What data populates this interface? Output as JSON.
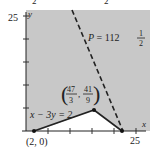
{
  "figure": {
    "type": "linear-programming-feasible-region",
    "axes": {
      "x_label": "x",
      "y_label": "y",
      "x_max_tick_label": "25",
      "y_max_tick_label": "25",
      "x_range": [
        0,
        25
      ],
      "y_range": [
        0,
        25
      ],
      "tick_step": 5
    },
    "top_cut_labels": [
      "2",
      "2"
    ],
    "objective_line": {
      "label_prefix": "P = 112",
      "label_frac_num": "1",
      "label_frac_den": "2",
      "style": "dashed"
    },
    "constraint_line": {
      "label": "x − 3y = 2"
    },
    "vertices": [
      {
        "name": "vertex-2-0",
        "label": "(2, 0)",
        "x": 2,
        "y": 0
      },
      {
        "name": "vertex-47-3-41-9",
        "label_x_num": "47",
        "label_x_den": "3",
        "label_y_num": "41",
        "label_y_den": "9",
        "x": 15.667,
        "y": 4.556
      },
      {
        "name": "vertex-x-intercept",
        "x": 22.5,
        "y": 0
      }
    ],
    "colors": {
      "region_fill": "#c8c8c8",
      "line": "#222222",
      "background": "#ffffff"
    }
  }
}
